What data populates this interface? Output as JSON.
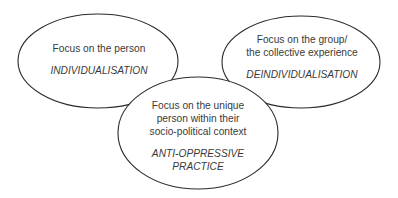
{
  "diagram": {
    "stroke_color": "#2a2a2a",
    "fill_color": "#ffffff",
    "text_color": "#3a3a3a",
    "nodes": [
      {
        "id": "individualisation",
        "lines": [
          "Focus on the person"
        ],
        "term": "INDIVIDUALISATION"
      },
      {
        "id": "deindividualisation",
        "lines": [
          "Focus on the group/",
          "the collective experience"
        ],
        "term": "DEINDIVIDUALISATION"
      },
      {
        "id": "anti-oppressive-practice",
        "lines": [
          "Focus on the unique",
          "person within their",
          "socio-political context"
        ],
        "term_lines": [
          "ANTI-OPPRESSIVE",
          "PRACTICE"
        ]
      }
    ]
  }
}
